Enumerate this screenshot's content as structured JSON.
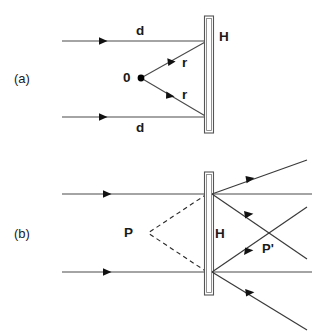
{
  "figure": {
    "background_color": "#ffffff",
    "line_color": "#4a4a4a",
    "text_color": "#1a1a1a",
    "panels": [
      {
        "id": "a",
        "label": "(a)",
        "description": "Recording: two parallel reference beams of path length d and two object beams of radius r from point source 0 meeting the holographic plate H",
        "labels": {
          "panel": "(a)",
          "plate": "H",
          "source_point": "0",
          "top_beam": "d",
          "bottom_beam": "d",
          "top_radius": "r",
          "bottom_radius": "r"
        }
      },
      {
        "id": "b",
        "label": "(b)",
        "description": "Reconstruction: parallel beams illuminate plate H producing a virtual image point P behind the plate and a real image point P' in front of the plate",
        "labels": {
          "panel": "(b)",
          "plate": "H",
          "virtual_image": "P",
          "real_image": "P'"
        }
      }
    ]
  }
}
